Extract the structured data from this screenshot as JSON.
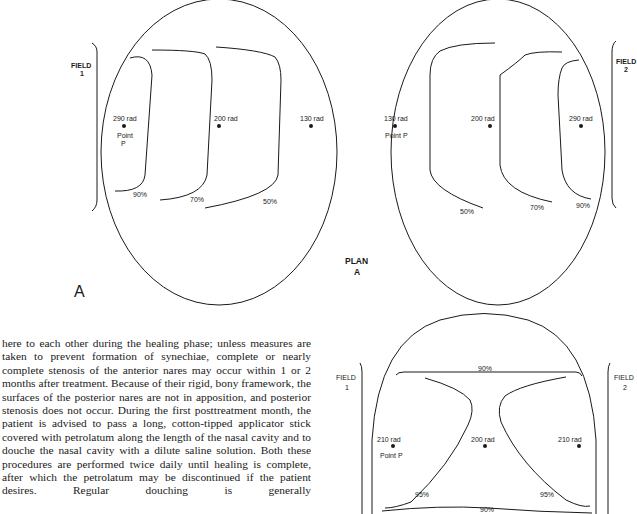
{
  "figure": {
    "panel_label": "A",
    "plan_label_line1": "PLAN",
    "plan_label_line2": "A",
    "left_view": {
      "field_label_line1": "FIELD",
      "field_label_line2": "1",
      "points": [
        {
          "dose": "290 rad",
          "name_line1": "Point",
          "name_line2": "P"
        },
        {
          "dose": "200 rad"
        },
        {
          "dose": "130 rad"
        }
      ],
      "isodose": [
        "90%",
        "70%",
        "50%"
      ]
    },
    "right_view": {
      "field_label_line1": "FIELD",
      "field_label_line2": "2",
      "points": [
        {
          "dose": "130 rad",
          "name": "Point P"
        },
        {
          "dose": "200 rad"
        },
        {
          "dose": "290 rad"
        }
      ],
      "isodose": [
        "50%",
        "70%",
        "90%"
      ]
    },
    "bottom_view": {
      "field1_line1": "FIELD",
      "field1_line2": "1",
      "field2_line1": "FIELD",
      "field2_line2": "2",
      "top_isodose": "90%",
      "bottom_isodose": "90%",
      "left_isodose": "95%",
      "right_isodose": "95%",
      "points": [
        {
          "dose": "210 rad",
          "name": "Point P"
        },
        {
          "dose": "200 rad"
        },
        {
          "dose": "210 rad"
        }
      ]
    }
  },
  "body_text": {
    "paragraph": "here to each other during the healing phase; unless measures are taken to prevent formation of synechiae, complete or nearly complete stenosis of the anterior nares may occur within 1 or 2 months after treatment. Because of their rigid, bony framework, the surfaces of the posterior nares are not in apposition, and posterior stenosis does not occur. During the first posttreatment month, the patient is advised to pass a long, cotton-tipped applicator stick covered with petrolatum along the length of the nasal cavity and to douche the nasal cavity with a dilute saline solution. Both these procedures are performed twice daily until healing is complete, after which the petrolatum may be discontinued if the patient desires. Regular douching is generally"
  }
}
